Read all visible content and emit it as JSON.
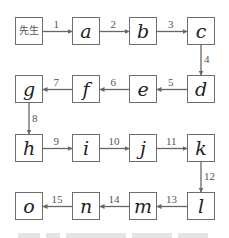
{
  "diagram": {
    "type": "flowchart",
    "start_label": "先生",
    "nodes": [
      "先生",
      "a",
      "b",
      "c",
      "d",
      "e",
      "f",
      "g",
      "h",
      "i",
      "j",
      "k",
      "l",
      "m",
      "n",
      "o"
    ],
    "edges": [
      {
        "from": "先生",
        "to": "a",
        "label": "1"
      },
      {
        "from": "a",
        "to": "b",
        "label": "2"
      },
      {
        "from": "b",
        "to": "c",
        "label": "3"
      },
      {
        "from": "c",
        "to": "d",
        "label": "4"
      },
      {
        "from": "d",
        "to": "e",
        "label": "5"
      },
      {
        "from": "e",
        "to": "f",
        "label": "6"
      },
      {
        "from": "f",
        "to": "g",
        "label": "7"
      },
      {
        "from": "g",
        "to": "h",
        "label": "8"
      },
      {
        "from": "h",
        "to": "i",
        "label": "9"
      },
      {
        "from": "i",
        "to": "j",
        "label": "10"
      },
      {
        "from": "j",
        "to": "k",
        "label": "11"
      },
      {
        "from": "k",
        "to": "l",
        "label": "12"
      },
      {
        "from": "l",
        "to": "m",
        "label": "13"
      },
      {
        "from": "m",
        "to": "n",
        "label": "14"
      },
      {
        "from": "n",
        "to": "o",
        "label": "15"
      }
    ],
    "colors": {
      "line": "#666666",
      "text": "#222222",
      "label": "#555555"
    }
  }
}
